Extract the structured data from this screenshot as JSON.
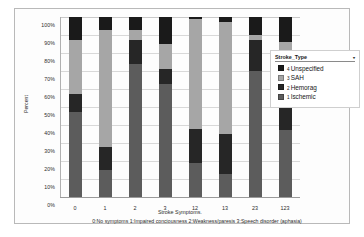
{
  "chart_data": {
    "type": "bar",
    "stacked": true,
    "normalized_percent": true,
    "title": "",
    "xlabel": "Stroke Symptoms.",
    "ylabel": "Percent",
    "ylim": [
      0,
      100
    ],
    "ytick_labels": [
      "0%",
      "10%",
      "20%",
      "30%",
      "40%",
      "50%",
      "60%",
      "70%",
      "80%",
      "90%",
      "100%"
    ],
    "ytick_values": [
      0,
      10,
      20,
      30,
      40,
      50,
      60,
      70,
      80,
      90,
      100
    ],
    "grid": true,
    "legend_position": "right",
    "legend_title": "Stroke_Type",
    "categories": [
      "0",
      "1",
      "2",
      "3",
      "12",
      "13",
      "23",
      "123"
    ],
    "series": [
      {
        "name": "1 Ischemic",
        "index": "1",
        "color": "#5c5c5c",
        "values": [
          47,
          15,
          74,
          63,
          19,
          13,
          70,
          37
        ]
      },
      {
        "name": "2 Hemorag",
        "index": "2",
        "color": "#262626",
        "values": [
          10,
          13,
          13,
          8,
          19,
          22,
          17,
          13
        ]
      },
      {
        "name": "3 SAH",
        "index": "3",
        "color": "#a6a6a6",
        "values": [
          30,
          65,
          6,
          14,
          61,
          62,
          3,
          36
        ]
      },
      {
        "name": "4 Unspecified",
        "index": "4",
        "color": "#1a1a1a",
        "values": [
          13,
          7,
          7,
          15,
          1,
          3,
          10,
          14
        ]
      }
    ],
    "footnote": "0:No symptoms 1:Impaired conciousness 2:Weakness/paresis 3:Speech disorder (aphasia)"
  },
  "legend": {
    "title": "Stroke_Type",
    "caret": "▾",
    "items": [
      {
        "index": "4",
        "label": "Unspecified",
        "color": "#1a1a1a"
      },
      {
        "index": "3",
        "label": "SAH",
        "color": "#a6a6a6"
      },
      {
        "index": "2",
        "label": "Hemorag",
        "color": "#262626"
      },
      {
        "index": "1",
        "label": "Ischemic",
        "color": "#5c5c5c"
      }
    ]
  }
}
